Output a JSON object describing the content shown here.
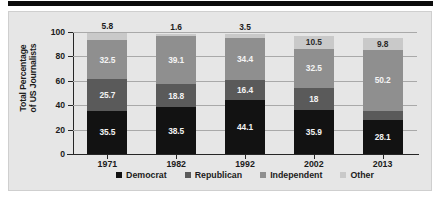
{
  "chart_data": {
    "type": "bar",
    "subtype": "stacked-bar",
    "title": "",
    "xlabel": "",
    "ylabel": "Total Percentage of US Journalists",
    "ylabel_line1": "Total Percentage",
    "ylabel_line2": "of US Journalists",
    "categories": [
      "1971",
      "1982",
      "1992",
      "2002",
      "2013"
    ],
    "ylim": [
      0,
      100
    ],
    "yticks": [
      0,
      20,
      40,
      60,
      80,
      100
    ],
    "ytick_labels": [
      "0",
      "20",
      "40",
      "60",
      "80",
      "100"
    ],
    "grid": true,
    "legend_position": "bottom",
    "series": [
      {
        "name": "Democrat",
        "color": "#121212",
        "label_color": "#f2f2f2",
        "values": [
          35.5,
          38.5,
          44.1,
          35.9,
          28.1
        ],
        "labels": [
          "35.5",
          "38.5",
          "44.1",
          "35.9",
          "28.1"
        ]
      },
      {
        "name": "Republican",
        "color": "#5a5a5a",
        "label_color": "#f2f2f2",
        "values": [
          25.7,
          18.8,
          16.4,
          18,
          7.1
        ],
        "labels": [
          "25.7",
          "18.8",
          "16.4",
          "18",
          "7.1"
        ]
      },
      {
        "name": "Independent",
        "color": "#8f8f8f",
        "label_color": "#f4f4f4",
        "values": [
          32.5,
          39.1,
          34.4,
          32.5,
          50.2
        ],
        "labels": [
          "32.5",
          "39.1",
          "34.4",
          "32.5",
          "50.2"
        ]
      },
      {
        "name": "Other",
        "color": "#c9c9c9",
        "label_color": "#2a2a2a",
        "values": [
          5.8,
          1.6,
          3.5,
          10.5,
          9.8
        ],
        "labels": [
          "5.8",
          "1.6",
          "3.5",
          "10.5",
          "9.8"
        ]
      }
    ]
  },
  "legend": {
    "items": [
      {
        "label": "Democrat",
        "color": "#121212"
      },
      {
        "label": "Republican",
        "color": "#5a5a5a"
      },
      {
        "label": "Independent",
        "color": "#8f8f8f"
      },
      {
        "label": "Other",
        "color": "#c9c9c9"
      }
    ]
  }
}
